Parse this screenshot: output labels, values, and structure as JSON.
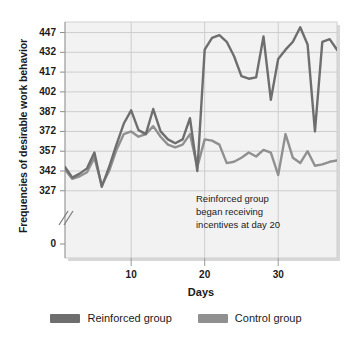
{
  "chart_data": {
    "type": "line",
    "title": "",
    "xlabel": "Days",
    "ylabel": "Frequencies of desirable work behavior",
    "xlim": [
      1,
      38
    ],
    "ylim": [
      320,
      455
    ],
    "yticks": [
      327,
      342,
      357,
      372,
      387,
      402,
      417,
      432,
      447
    ],
    "ytick_labels": [
      "327",
      "342",
      "357",
      "372",
      "387",
      "402",
      "417",
      "432",
      "447"
    ],
    "y_origin_label": "0",
    "y_axis_break": true,
    "xticks": [
      10,
      20,
      30
    ],
    "xtick_labels": [
      "10",
      "20",
      "30"
    ],
    "grid": true,
    "legend_position": "bottom",
    "annotations": [
      {
        "text": "Reinforced group\nbegan receiving\nincentives at day 20",
        "x": 21,
        "y": 336
      }
    ],
    "x": [
      1,
      2,
      3,
      4,
      5,
      6,
      7,
      8,
      9,
      10,
      11,
      12,
      13,
      14,
      15,
      16,
      17,
      18,
      19,
      20,
      21,
      22,
      23,
      24,
      25,
      26,
      27,
      28,
      29,
      30,
      31,
      32,
      33,
      34,
      35,
      36,
      37,
      38
    ],
    "series": [
      {
        "name": "Reinforced group",
        "color": "#6e6e6e",
        "values": [
          345,
          337,
          340,
          344,
          356,
          330,
          345,
          362,
          378,
          388,
          373,
          370,
          389,
          372,
          366,
          363,
          366,
          382,
          342,
          434,
          443,
          445,
          440,
          429,
          414,
          412,
          413,
          444,
          396,
          427,
          434,
          440,
          451,
          438,
          372,
          440,
          442,
          434
        ]
      },
      {
        "name": "Control group",
        "color": "#909090",
        "values": [
          343,
          336,
          338,
          341,
          352,
          331,
          342,
          358,
          370,
          372,
          368,
          370,
          376,
          368,
          362,
          360,
          362,
          370,
          345,
          366,
          365,
          362,
          348,
          349,
          352,
          356,
          353,
          358,
          356,
          339,
          370,
          352,
          348,
          357,
          346,
          347,
          349,
          350
        ]
      }
    ]
  },
  "legend": {
    "items": [
      {
        "label": "Reinforced group",
        "color": "#6e6e6e"
      },
      {
        "label": "Control group",
        "color": "#909090"
      }
    ]
  }
}
